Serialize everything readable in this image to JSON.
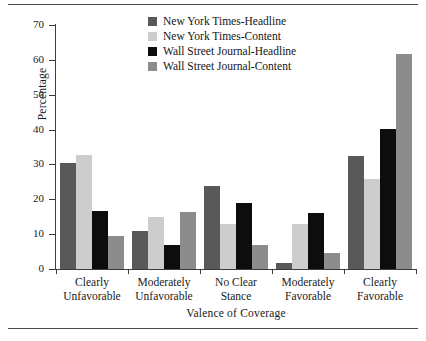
{
  "chart_data": {
    "type": "bar",
    "title": "",
    "xlabel": "Valence of Coverage",
    "ylabel": "Percentage",
    "ylim": [
      0,
      70
    ],
    "yticks": [
      0,
      10,
      20,
      30,
      40,
      50,
      60,
      70
    ],
    "grid": false,
    "legend_position": "top-center",
    "categories": [
      "Clearly Unfavorable",
      "Moderately Unfavorable",
      "No Clear Stance",
      "Moderately Favorable",
      "Clearly Favorable"
    ],
    "category_lines": [
      [
        "Clearly",
        "Unfavorable"
      ],
      [
        "Moderately",
        "Unfavorable"
      ],
      [
        "No Clear",
        "Stance"
      ],
      [
        "Moderately",
        "Favorable"
      ],
      [
        "Clearly",
        "Favorable"
      ]
    ],
    "series": [
      {
        "name": "New York Times-Headline",
        "color": "#595959",
        "values": [
          30.5,
          10.8,
          23.7,
          1.8,
          32.3
        ]
      },
      {
        "name": "New York Times-Content",
        "color": "#cdcdcd",
        "values": [
          32.6,
          15.0,
          12.8,
          12.8,
          25.8
        ]
      },
      {
        "name": "Wall Street Journal-Headline",
        "color": "#0d0d0d",
        "values": [
          16.6,
          7.0,
          18.8,
          16.2,
          40.1
        ]
      },
      {
        "name": "Wall Street Journal-Content",
        "color": "#8c8c8c",
        "values": [
          9.6,
          16.4,
          6.8,
          4.5,
          61.7
        ]
      }
    ]
  },
  "axis": {
    "y_title": "Percentage",
    "x_title": "Valence of Coverage",
    "y_tick_labels": [
      "0",
      "10",
      "20",
      "30",
      "40",
      "50",
      "60",
      "70"
    ]
  }
}
